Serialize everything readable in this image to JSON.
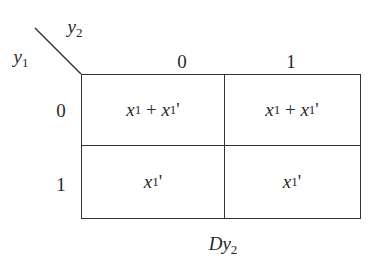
{
  "diagram": {
    "type": "karnaugh-map",
    "corner": {
      "col_var": {
        "base": "y",
        "sub": "2"
      },
      "row_var": {
        "base": "y",
        "sub": "1"
      }
    },
    "col_headers": [
      "0",
      "1"
    ],
    "row_headers": [
      "0",
      "1"
    ],
    "cells": [
      [
        {
          "a": "x",
          "a_sub": "1",
          "op": " + ",
          "b": "x",
          "b_sub": "1",
          "b_prime": "'"
        },
        {
          "a": "x",
          "a_sub": "1",
          "op": " + ",
          "b": "x",
          "b_sub": "1",
          "b_prime": "'"
        }
      ],
      [
        {
          "a": "x",
          "a_sub": "1",
          "a_prime": "'"
        },
        {
          "a": "x",
          "a_sub": "1",
          "a_prime": "'"
        }
      ]
    ],
    "caption": {
      "base": "Dy",
      "sub": "2"
    }
  }
}
